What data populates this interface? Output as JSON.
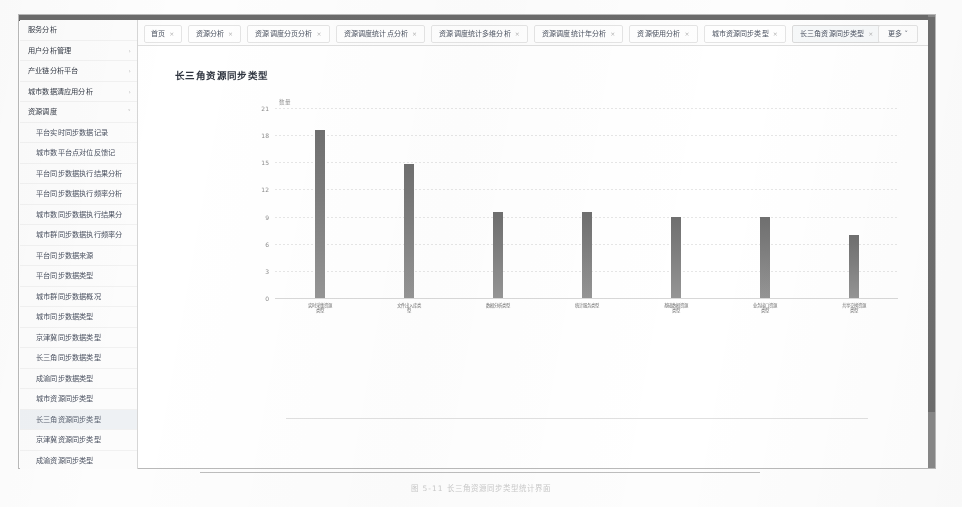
{
  "window": {
    "title": "资源同步分析平台"
  },
  "sidebar": {
    "items": [
      {
        "label": "服务分析",
        "level": "group",
        "caret": "",
        "selected": false
      },
      {
        "label": "用户分析管理",
        "level": "group",
        "caret": "›",
        "selected": false
      },
      {
        "label": "产业链分析平台",
        "level": "group",
        "caret": "›",
        "selected": false
      },
      {
        "label": "城市数据清应用分析",
        "level": "group",
        "caret": "›",
        "selected": false
      },
      {
        "label": "资源调度",
        "level": "group",
        "caret": "˅",
        "selected": false
      },
      {
        "label": "平台实时同步数据记录",
        "level": "child",
        "caret": "",
        "selected": false
      },
      {
        "label": "城市数平台点对位反馈记",
        "level": "child",
        "caret": "",
        "selected": false
      },
      {
        "label": "平台同步数据执行结果分析",
        "level": "child",
        "caret": "",
        "selected": false
      },
      {
        "label": "平台同步数据执行频率分析",
        "level": "child",
        "caret": "",
        "selected": false
      },
      {
        "label": "城市数同步数据执行结果分",
        "level": "child",
        "caret": "",
        "selected": false
      },
      {
        "label": "城市群同步数据执行频率分",
        "level": "child",
        "caret": "",
        "selected": false
      },
      {
        "label": "平台同步数据来源",
        "level": "child",
        "caret": "",
        "selected": false
      },
      {
        "label": "平台同步数据类型",
        "level": "child",
        "caret": "",
        "selected": false
      },
      {
        "label": "城市群同步数据概况",
        "level": "child",
        "caret": "",
        "selected": false
      },
      {
        "label": "城市同步数据类型",
        "level": "child",
        "caret": "",
        "selected": false
      },
      {
        "label": "京津冀同步数据类型",
        "level": "child",
        "caret": "",
        "selected": false
      },
      {
        "label": "长三角同步数据类型",
        "level": "child",
        "caret": "",
        "selected": false
      },
      {
        "label": "成渝同步数据类型",
        "level": "child",
        "caret": "",
        "selected": false
      },
      {
        "label": "城市资源同步类型",
        "level": "child",
        "caret": "",
        "selected": false
      },
      {
        "label": "长三角资源同步类型",
        "level": "child",
        "caret": "",
        "selected": true
      },
      {
        "label": "京津冀资源同步类型",
        "level": "child",
        "caret": "",
        "selected": false
      },
      {
        "label": "成渝资源同步类型",
        "level": "child",
        "caret": "",
        "selected": false
      },
      {
        "label": "分析平台菜单管理",
        "level": "group",
        "caret": "›",
        "selected": false
      },
      {
        "label": "资源池项分析",
        "level": "group",
        "caret": "›",
        "selected": false
      },
      {
        "label": "用户行为分析",
        "level": "group",
        "caret": "›",
        "selected": false
      },
      {
        "label": "用户活跃度对分析",
        "level": "group",
        "caret": "›",
        "selected": false
      },
      {
        "label": "构建资源分析",
        "level": "group",
        "caret": "›",
        "selected": false
      },
      {
        "label": "多平台用户融合",
        "level": "group",
        "caret": "›",
        "selected": false
      },
      {
        "label": "基础数据同步分析",
        "level": "group",
        "caret": "›",
        "selected": false
      }
    ]
  },
  "tabs": {
    "items": [
      {
        "label": "首页",
        "closable": true,
        "active": false
      },
      {
        "label": "资源分析",
        "closable": true,
        "active": false
      },
      {
        "label": "资源调度分页分析",
        "closable": true,
        "active": false
      },
      {
        "label": "资源调度统计点分析",
        "closable": true,
        "active": false
      },
      {
        "label": "资源调度统计多维分析",
        "closable": true,
        "active": false
      },
      {
        "label": "资源调度统计年分析",
        "closable": true,
        "active": false
      },
      {
        "label": "资源使用分析",
        "closable": true,
        "active": false
      },
      {
        "label": "城市资源同步类型",
        "closable": true,
        "active": false
      },
      {
        "label": "长三角资源同步类型",
        "closable": true,
        "active": true
      }
    ],
    "more_label": "更多 ˅"
  },
  "chart_data": {
    "type": "bar",
    "title": "长三角资源同步类型",
    "xlabel": "",
    "ylabel": "数量",
    "ylim": [
      0,
      22
    ],
    "yticks": [
      0,
      3,
      6,
      9,
      12,
      15,
      18,
      21
    ],
    "grid": true,
    "legend": false,
    "bar_color": "#7a7a7a",
    "categories": [
      "实时采集\n资源类型",
      "文件出入库\n类型",
      "数据分析\n类型",
      "统计服务\n类型",
      "基础数据\n资源类型",
      "业务接口\n资源类型",
      "共享交换\n资源类型"
    ],
    "values": [
      18.6,
      14.8,
      9.5,
      9.5,
      9.0,
      9.0,
      7.0
    ]
  },
  "caption": {
    "text": "图 5-11  长三角资源同步类型统计界面"
  }
}
